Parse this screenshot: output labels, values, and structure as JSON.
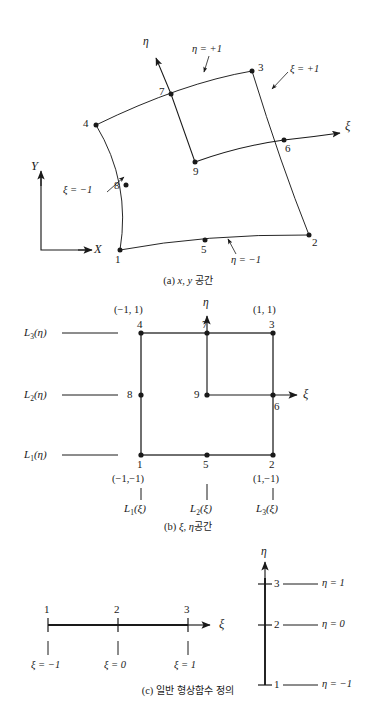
{
  "figure": {
    "panels": [
      {
        "id": "a",
        "caption_prefix": "(a)",
        "caption_vars": "x, y",
        "caption_text": "공간",
        "type": "curved-quadrilateral-element",
        "nodes": [
          "1",
          "2",
          "3",
          "4",
          "5",
          "6",
          "7",
          "8",
          "9"
        ],
        "edge_labels": [
          {
            "name": "eta-plus-one",
            "text": "η = +1"
          },
          {
            "name": "eta-minus-one",
            "text": "η = −1"
          },
          {
            "name": "xi-plus-one",
            "text": "ξ = +1"
          },
          {
            "name": "xi-minus-one",
            "text": "ξ = −1"
          }
        ],
        "axes": [
          {
            "name": "eta-axis",
            "label": "η"
          },
          {
            "name": "xi-axis",
            "label": "ξ"
          },
          {
            "name": "y-axis",
            "label": "Y"
          },
          {
            "name": "x-axis",
            "label": "X"
          }
        ]
      },
      {
        "id": "b",
        "caption_prefix": "(b)",
        "caption_vars": "ξ, η",
        "caption_text": "공간",
        "type": "unit-square-master-element",
        "nodes": [
          "1",
          "2",
          "3",
          "4",
          "5",
          "6",
          "7",
          "8",
          "9"
        ],
        "corner_coords": [
          {
            "name": "coord-node-4",
            "text": "(−1, 1)"
          },
          {
            "name": "coord-node-3",
            "text": "(1, 1)"
          },
          {
            "name": "coord-node-1",
            "text": "(−1,−1)"
          },
          {
            "name": "coord-node-2",
            "text": "(1,−1)"
          }
        ],
        "row_functions": [
          {
            "name": "L3-eta",
            "base": "L",
            "sub": "3",
            "arg": "(η)"
          },
          {
            "name": "L2-eta",
            "base": "L",
            "sub": "2",
            "arg": "(η)"
          },
          {
            "name": "L1-eta",
            "base": "L",
            "sub": "1",
            "arg": "(η)"
          }
        ],
        "col_functions": [
          {
            "name": "L1-xi",
            "base": "L",
            "sub": "1",
            "arg": "(ξ)"
          },
          {
            "name": "L2-xi",
            "base": "L",
            "sub": "2",
            "arg": "(ξ)"
          },
          {
            "name": "L3-xi",
            "base": "L",
            "sub": "3",
            "arg": "(ξ)"
          }
        ],
        "axes": [
          {
            "name": "eta-axis",
            "label": "η"
          },
          {
            "name": "xi-axis",
            "label": "ξ"
          }
        ]
      },
      {
        "id": "c",
        "caption_prefix": "(c)",
        "caption_text": "일반 형상함수 정의",
        "type": "one-dimensional-node-lines",
        "xi_line": {
          "axis_label": "ξ",
          "nodes": [
            "1",
            "2",
            "3"
          ],
          "values": [
            "ξ = −1",
            "ξ = 0",
            "ξ = 1"
          ]
        },
        "eta_line": {
          "axis_label": "η",
          "nodes": [
            "3",
            "2",
            "1"
          ],
          "values": [
            "η = 1",
            "η = 0",
            "η = −1"
          ]
        }
      }
    ],
    "colors": {
      "ink": "#1a1a1a",
      "background": "#ffffff"
    }
  }
}
